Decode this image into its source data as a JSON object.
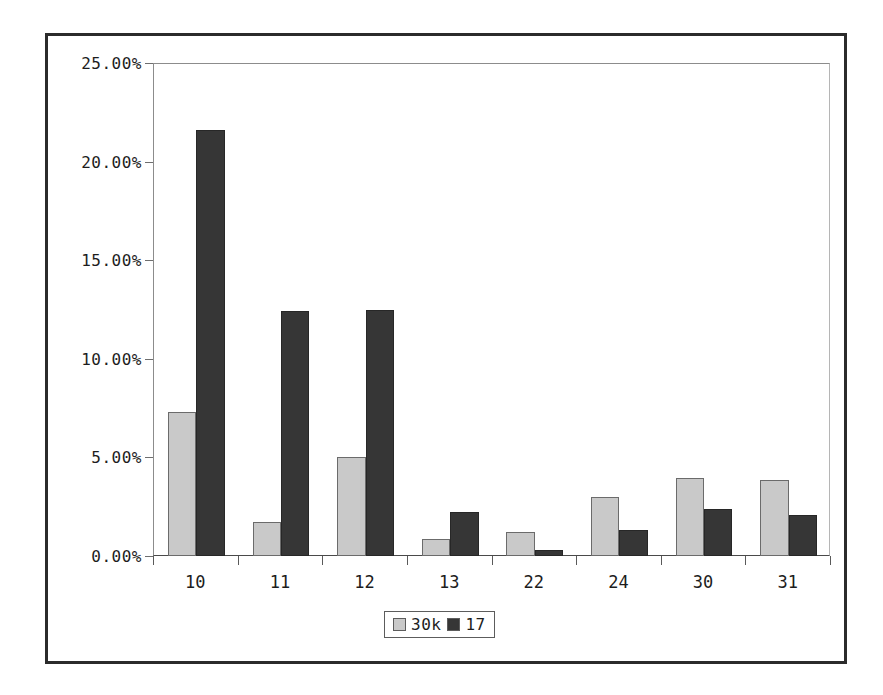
{
  "chart_data": {
    "type": "bar",
    "title": "",
    "subtitle": "",
    "xlabel": "",
    "ylabel": "",
    "categories": [
      "10",
      "11",
      "12",
      "13",
      "22",
      "24",
      "30",
      "31"
    ],
    "series": [
      {
        "name": "30k",
        "color": "#c9c9c9",
        "values": [
          7.3,
          1.75,
          5.0,
          0.85,
          1.2,
          3.0,
          3.95,
          3.85
        ]
      },
      {
        "name": "17",
        "color": "#363636",
        "values": [
          21.6,
          12.4,
          12.5,
          2.25,
          0.3,
          1.3,
          2.4,
          2.1
        ]
      }
    ],
    "ylim": [
      0,
      25
    ],
    "ytick_values": [
      0,
      5,
      10,
      15,
      20,
      25
    ],
    "ytick_labels": [
      "0.00%",
      "5.00%",
      "10.00%",
      "15.00%",
      "20.00%",
      "25.00%"
    ],
    "grid": false,
    "legend_position": "bottom",
    "frame": true
  },
  "legend": {
    "entries": [
      {
        "label": "30k",
        "color": "#c9c9c9"
      },
      {
        "label": "17",
        "color": "#363636"
      }
    ]
  },
  "colors": {
    "series_light": "#c9c9c9",
    "series_dark": "#363636",
    "frame_border": "#2b2b2b",
    "axis": "#6e6e6e",
    "text": "#1d1d1d",
    "background": "#ffffff"
  }
}
